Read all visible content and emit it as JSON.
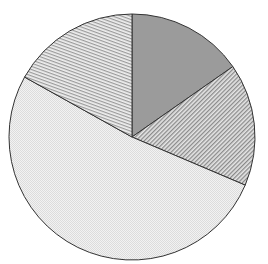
{
  "chart_data": {
    "type": "pie",
    "title": "",
    "start_angle_deg": 0,
    "direction": "clockwise",
    "center": [
      132,
      137
    ],
    "radius": 123,
    "slices": [
      {
        "label": "",
        "value": 15.3,
        "fill": "solid",
        "color": "#9a9a9a"
      },
      {
        "label": "",
        "value": 16.1,
        "fill": "hatch-diagonal-back",
        "color": "#7a7a7a"
      },
      {
        "label": "",
        "value": 51.7,
        "fill": "dots-light",
        "color": "#c8c8c8"
      },
      {
        "label": "",
        "value": 16.9,
        "fill": "hatch-near-horizontal",
        "color": "#8a8a8a"
      }
    ],
    "values": [
      15.3,
      16.1,
      51.7,
      16.9
    ],
    "categories": [
      "",
      "",
      "",
      ""
    ],
    "legend": "none",
    "stroke_color": "#333333"
  }
}
